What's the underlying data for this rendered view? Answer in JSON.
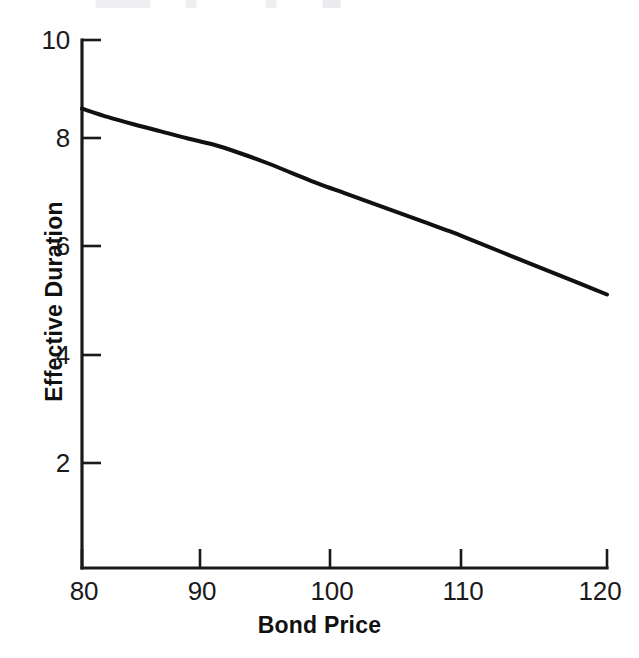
{
  "figure": {
    "background_color": "#ffffff",
    "ink_color": "#1a1a1a"
  },
  "chart_data": {
    "type": "line",
    "title": "",
    "subtitle": "",
    "xlabel": "Bond Price",
    "ylabel": "Effective Duration",
    "xlim": [
      80,
      120
    ],
    "ylim": [
      0,
      10
    ],
    "xticks": [
      80,
      90,
      100,
      110,
      120
    ],
    "xtick_labels": [
      "80",
      "90",
      "100",
      "110",
      "120"
    ],
    "yticks": [
      2,
      4,
      6,
      8,
      10
    ],
    "ytick_labels": [
      "2",
      "4",
      "6",
      "8",
      "10"
    ],
    "grid": false,
    "legend": null,
    "tick_direction": "in",
    "spines": [
      "left",
      "bottom"
    ],
    "annotations": [],
    "series": [
      {
        "name": "Effective Duration",
        "color": "#111111",
        "line_width": 4,
        "marker": "none",
        "x": [
          80,
          82,
          84,
          86,
          88,
          90,
          92,
          94,
          96,
          98,
          100,
          102,
          104,
          106,
          108,
          110,
          112,
          114,
          116,
          118,
          120
        ],
        "y": [
          8.7,
          8.54,
          8.4,
          8.27,
          8.14,
          8.02,
          7.86,
          7.68,
          7.48,
          7.28,
          7.1,
          6.92,
          6.74,
          6.56,
          6.38,
          6.18,
          5.98,
          5.78,
          5.58,
          5.38,
          5.18
        ]
      }
    ]
  },
  "axes_titles": {
    "x": "Bond Price",
    "y": "Effective Duration"
  }
}
